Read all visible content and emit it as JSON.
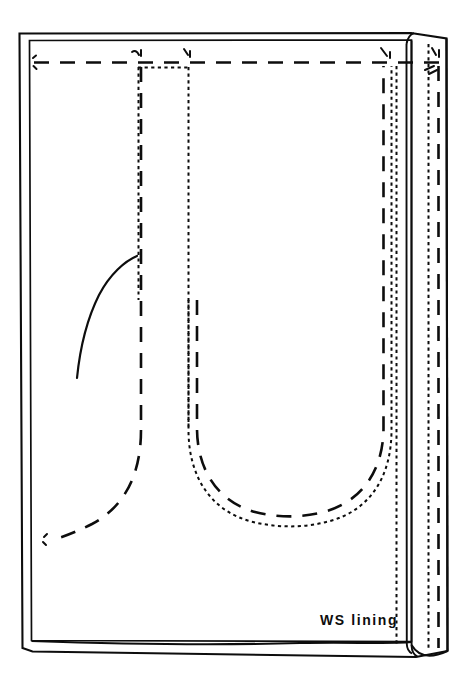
{
  "diagram": {
    "kind": "sewing-pattern-illustration",
    "canvas": {
      "width": 473,
      "height": 685
    },
    "background_color": "#ffffff",
    "ink_color": "#0d0d0d",
    "labels": [
      {
        "id": "ws-lining",
        "text": "WS lining",
        "meaning": "wrong side of lining fabric",
        "x": 320,
        "y": 612
      }
    ],
    "line_legend": [
      {
        "style": "solid",
        "meaning": "cut edge / fold edge of fabric"
      },
      {
        "style": "long-dash",
        "meaning": "stitching line"
      },
      {
        "style": "fine-dotted",
        "meaning": "hidden edge beneath fold"
      }
    ],
    "regions": {
      "main_panel": "large rectangular lining body",
      "right_facing": "narrow folded facing strip at right edge",
      "pocket_opening": "dotted rectangle at upper centre",
      "u_seam": "U shaped double seam line through centre",
      "left_curve": "solid curved armhole / dart guide at left"
    }
  },
  "geometry": {
    "body_outer": "M 18 34 L 18 645 L 33 653 L 414 653 L 414 40 Z",
    "body_inner_top_y": 40,
    "body_inner_left_x": 30,
    "top_stitch_y": 62,
    "facing_fold_x": [
      396,
      407,
      411,
      428,
      438,
      447
    ],
    "pocket_rect": {
      "x1": 138,
      "y1": 67,
      "x2": 188,
      "y2": 470
    },
    "u_seam_outer_left_x": 141,
    "u_seam_right_x": 392
  }
}
